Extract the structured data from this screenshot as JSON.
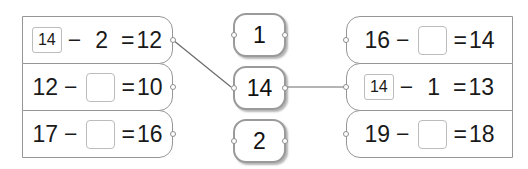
{
  "theme": {
    "background": "#ffffff",
    "card_border": "#969696",
    "chip_border": "#9a9a9a",
    "blank_border": "#bcbcbc",
    "text": "#1a1a1a",
    "wire": "#6b6b6b"
  },
  "left_column": {
    "name": "left-equation-column",
    "rows": [
      {
        "id": "left-row-1",
        "prefilled": true,
        "token": "14",
        "operator": "−",
        "operand": "2",
        "equals": "=",
        "result": "12",
        "connected": true
      },
      {
        "id": "left-row-2",
        "prefilled": false,
        "minuend": "12",
        "operator": "−",
        "blank": "",
        "equals": "=",
        "result": "10",
        "connected": false
      },
      {
        "id": "left-row-3",
        "prefilled": false,
        "minuend": "17",
        "operator": "−",
        "blank": "",
        "equals": "=",
        "result": "16",
        "connected": false
      }
    ]
  },
  "middle_column": {
    "name": "answer-chip-column",
    "chips": [
      {
        "id": "chip-1",
        "value": "1",
        "selected": false
      },
      {
        "id": "chip-14",
        "value": "14",
        "selected": true
      },
      {
        "id": "chip-2",
        "value": "2",
        "selected": false
      }
    ]
  },
  "right_column": {
    "name": "right-equation-column",
    "rows": [
      {
        "id": "right-row-1",
        "prefilled": false,
        "minuend": "16",
        "operator": "−",
        "blank": "",
        "equals": "=",
        "result": "14",
        "connected": false
      },
      {
        "id": "right-row-2",
        "prefilled": true,
        "token": "14",
        "operator": "−",
        "operand": "1",
        "equals": "=",
        "result": "13",
        "connected": true
      },
      {
        "id": "right-row-3",
        "prefilled": false,
        "minuend": "19",
        "operator": "−",
        "blank": "",
        "equals": "=",
        "result": "18",
        "connected": false
      }
    ]
  },
  "connections": [
    {
      "id": "wire-left1-to-chip14",
      "from": "left-row-1",
      "to": "chip-14",
      "kind": "diagonal"
    },
    {
      "id": "wire-chip14-to-right2",
      "from": "chip-14",
      "to": "right-row-2",
      "kind": "horizontal"
    }
  ]
}
